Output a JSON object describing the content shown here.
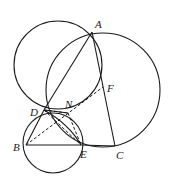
{
  "diagram": {
    "type": "geometry",
    "stroke_color": "#1a1a1a",
    "points": [
      {
        "id": "A",
        "label": "A",
        "x": 92,
        "y": 32,
        "lx": 95,
        "ly": 28
      },
      {
        "id": "F",
        "label": "F",
        "x": 103,
        "y": 87,
        "lx": 107,
        "ly": 92
      },
      {
        "id": "N",
        "label": "N",
        "x": 68,
        "y": 113,
        "lx": 65,
        "ly": 108
      },
      {
        "id": "D",
        "label": "D",
        "x": 44,
        "y": 110,
        "lx": 30,
        "ly": 116
      },
      {
        "id": "B",
        "label": "B",
        "x": 26,
        "y": 145,
        "lx": 13,
        "ly": 151
      },
      {
        "id": "E",
        "label": "E",
        "x": 81,
        "y": 145,
        "lx": 80,
        "ly": 158
      },
      {
        "id": "C",
        "label": "C",
        "x": 115,
        "y": 146,
        "lx": 116,
        "ly": 159
      }
    ],
    "circles": [
      {
        "id": "circle-left",
        "cx": 58,
        "cy": 65,
        "r": 44
      },
      {
        "id": "circle-right",
        "cx": 103,
        "cy": 90,
        "r": 57
      },
      {
        "id": "circle-small",
        "cx": 53,
        "cy": 143,
        "r": 30
      }
    ],
    "solid_segments": [
      [
        "A",
        "D"
      ],
      [
        "D",
        "B"
      ],
      [
        "B",
        "E"
      ],
      [
        "E",
        "C"
      ],
      [
        "A",
        "C"
      ],
      [
        "D",
        "N"
      ]
    ],
    "dashed_segments": [
      [
        "B",
        "F"
      ],
      [
        "D",
        "E"
      ],
      [
        "N",
        "E"
      ],
      [
        "D",
        "N"
      ]
    ],
    "arcs": [
      {
        "id": "arc-D-E",
        "from": "D",
        "to": "E"
      }
    ]
  }
}
